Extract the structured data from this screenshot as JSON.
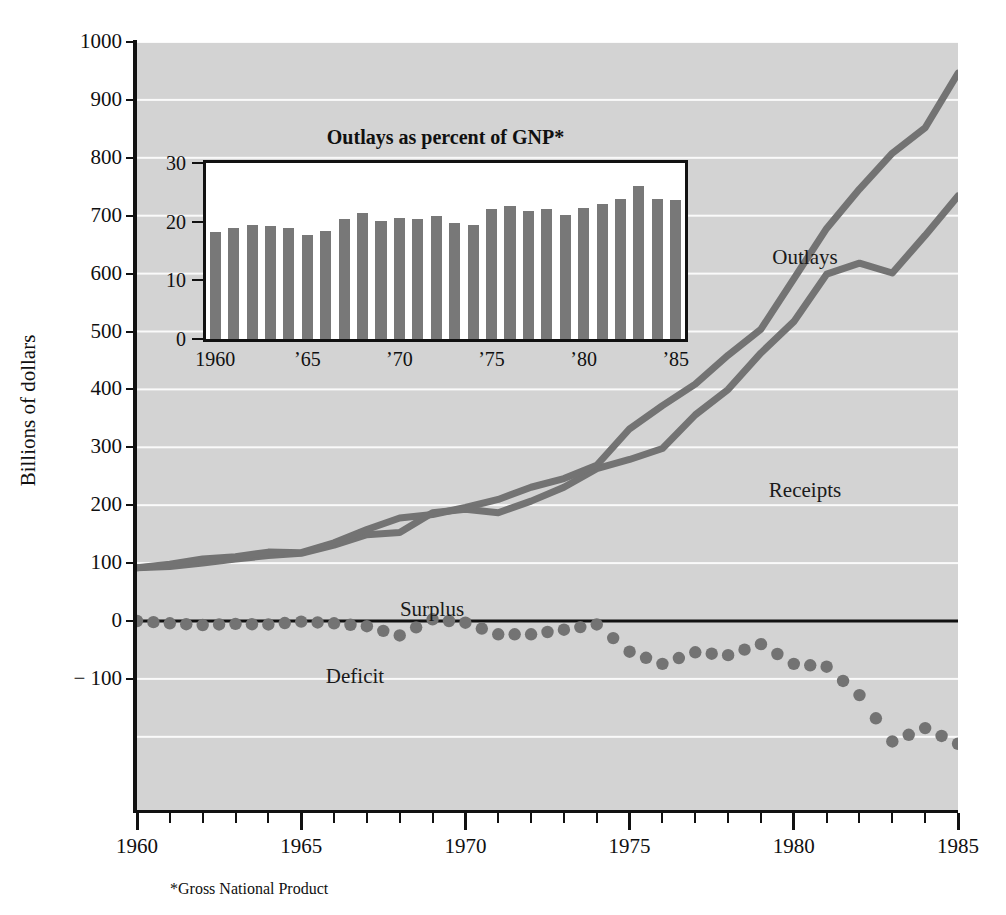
{
  "page": {
    "cut_title": "",
    "background_color": "#ffffff",
    "plot_background_color": "#d3d3d3",
    "line_color": "#737373",
    "bar_color": "#787878",
    "axis_color": "#111111",
    "gridline_color": "#fafafa"
  },
  "footnote": "*Gross National Product",
  "main": {
    "y_axis_title": "Billions of dollars",
    "y_ticks": [
      "1000",
      "900",
      "800",
      "700",
      "600",
      "500",
      "400",
      "300",
      "200",
      "100",
      "0",
      "− 100"
    ],
    "y_tick_values": [
      1000,
      900,
      800,
      700,
      600,
      500,
      400,
      300,
      200,
      100,
      0,
      -100
    ],
    "x_ticks": [
      "1960",
      "1965",
      "1970",
      "1975",
      "1980",
      "1985"
    ],
    "x_tick_values": [
      1960,
      1965,
      1970,
      1975,
      1980,
      1985
    ],
    "labels": {
      "outlays": "Outlays",
      "receipts": "Receipts",
      "surplus": "Surplus",
      "deficit": "Deficit"
    }
  },
  "inset": {
    "title": "Outlays as percent of GNP*",
    "y_ticks": [
      "30",
      "20",
      "10",
      "0"
    ],
    "y_tick_values": [
      30,
      20,
      10,
      0
    ],
    "x_ticks": [
      "1960",
      "’65",
      "’70",
      "’75",
      "’80",
      "’85"
    ],
    "x_tick_values": [
      1960,
      1965,
      1970,
      1975,
      1980,
      1985
    ]
  },
  "chart_data": [
    {
      "type": "line",
      "name": "federal-budget-main",
      "title": "",
      "xlabel": "",
      "ylabel": "Billions of dollars",
      "xlim": [
        1960,
        1985
      ],
      "ylim": [
        -210,
        1000
      ],
      "grid": true,
      "legend": "inline-annotations",
      "annotations": [
        "Outlays",
        "Receipts",
        "Surplus",
        "Deficit"
      ],
      "x": [
        1960,
        1961,
        1962,
        1963,
        1964,
        1965,
        1966,
        1967,
        1968,
        1969,
        1970,
        1971,
        1972,
        1973,
        1974,
        1975,
        1976,
        1977,
        1978,
        1979,
        1980,
        1981,
        1982,
        1983,
        1984,
        1985
      ],
      "series": [
        {
          "name": "Outlays",
          "values": [
            92,
            98,
            107,
            111,
            119,
            118,
            135,
            158,
            178,
            184,
            196,
            210,
            231,
            246,
            269,
            332,
            372,
            409,
            459,
            504,
            591,
            678,
            746,
            808,
            852,
            946
          ]
        },
        {
          "name": "Receipts",
          "values": [
            92,
            94,
            100,
            107,
            113,
            117,
            131,
            149,
            153,
            187,
            193,
            187,
            207,
            231,
            263,
            279,
            298,
            356,
            400,
            463,
            517,
            599,
            618,
            601,
            666,
            734
          ]
        },
        {
          "name": "Deficit",
          "values": [
            0,
            -4,
            -7,
            -5,
            -6,
            -1,
            -4,
            -9,
            -25,
            3,
            -3,
            -23,
            -23,
            -15,
            -6,
            -53,
            -74,
            -54,
            -59,
            -40,
            -74,
            -79,
            -128,
            -208,
            -185,
            -212
          ]
        }
      ]
    },
    {
      "type": "bar",
      "name": "outlays-percent-of-gnp-inset",
      "title": "Outlays as percent of GNP*",
      "xlabel": "",
      "ylabel": "",
      "ylim": [
        0,
        30
      ],
      "grid": false,
      "categories": [
        1960,
        1961,
        1962,
        1963,
        1964,
        1965,
        1966,
        1967,
        1968,
        1969,
        1970,
        1971,
        1972,
        1973,
        1974,
        1975,
        1976,
        1977,
        1978,
        1979,
        1980,
        1981,
        1982,
        1983,
        1984,
        1985
      ],
      "values": [
        18.2,
        19.0,
        19.5,
        19.2,
        19.0,
        17.8,
        18.4,
        20.4,
        21.4,
        20.2,
        20.6,
        20.5,
        21.0,
        19.8,
        19.5,
        22.2,
        22.6,
        21.8,
        22.1,
        21.1,
        22.3,
        23.0,
        23.8,
        26.0,
        23.9,
        23.7
      ]
    }
  ]
}
